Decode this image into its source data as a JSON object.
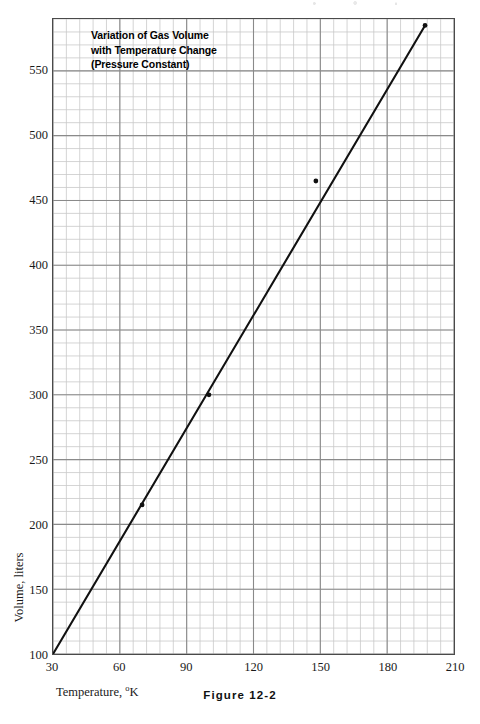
{
  "chart_data": {
    "type": "line",
    "title": "Variation of Gas Volume with Temperature Change (Pressure Constant)",
    "title_lines": [
      "Variation of Gas Volume",
      "with Temperature Change",
      "(Pressure Constant)"
    ],
    "xlabel": "Temperature, °K",
    "xlabel_text": "Temperature, ",
    "xlabel_sup": "o",
    "xlabel_tail": "K",
    "ylabel": "Volume, liters",
    "caption": "Figure 12-2",
    "xlim": [
      30,
      210
    ],
    "ylim": [
      100,
      590
    ],
    "xticks": [
      30,
      60,
      90,
      120,
      150,
      180,
      210
    ],
    "xtick_labels": [
      "30",
      "60",
      "90",
      "120",
      "150",
      "180",
      "210"
    ],
    "yticks": [
      100,
      150,
      200,
      250,
      300,
      350,
      400,
      450,
      500,
      550
    ],
    "ytick_labels": [
      "100",
      "150",
      "200",
      "250",
      "300",
      "350",
      "400",
      "450",
      "500",
      "550"
    ],
    "grid": true,
    "grid_major_x_step": 30,
    "grid_major_y_step": 50,
    "grid_minor_x_step": 6,
    "grid_minor_y_step": 10,
    "legend": null,
    "series": [
      {
        "name": "Gas volume vs temperature",
        "line_endpoints": [
          {
            "x": 30,
            "y": 100
          },
          {
            "x": 197,
            "y": 585
          }
        ],
        "x": [
          30,
          70,
          100,
          148,
          197
        ],
        "y": [
          100,
          215,
          300,
          465,
          585
        ],
        "markers": [
          {
            "x": 70,
            "y": 215
          },
          {
            "x": 100,
            "y": 300
          },
          {
            "x": 148,
            "y": 465
          },
          {
            "x": 197,
            "y": 585
          }
        ]
      }
    ],
    "colors": {
      "line": "#111111",
      "marker": "#111111",
      "grid_major": "#8a8a8a",
      "grid_minor": "#c9c9c9",
      "frame": "#4a4a4a",
      "text": "#1a1a1a",
      "background": "#ffffff"
    }
  }
}
